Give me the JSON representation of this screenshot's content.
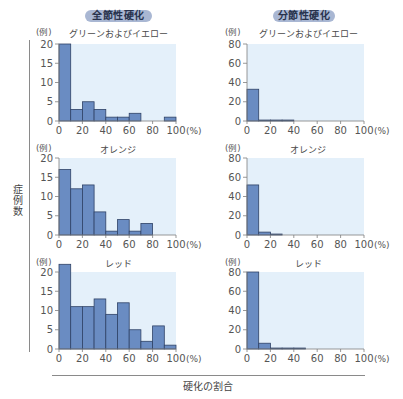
{
  "headers": {
    "left": "全節性硬化",
    "right": "分節性硬化"
  },
  "labels": {
    "y_axis": "症例数",
    "x_axis": "硬化の割合",
    "count_unit": "(例)",
    "percent_unit": "(%)"
  },
  "colors": {
    "pill_bg": "#a9b7d3",
    "plot_bg": "#e4f0fa",
    "bar_fill": "#6a8cc2",
    "bar_stroke": "#2f4266",
    "axis": "#7d7d7d",
    "tick_text": "#555555"
  },
  "chart_data": [
    {
      "type": "bar",
      "group": "全節性硬化",
      "title": "グリーンおよびイエロー",
      "bin_edges": [
        0,
        10,
        20,
        30,
        40,
        50,
        60,
        70,
        80,
        90,
        100
      ],
      "categories": [
        "0-10",
        "10-20",
        "20-30",
        "30-40",
        "40-50",
        "50-60",
        "60-70",
        "70-80",
        "80-90",
        "90-100"
      ],
      "values": [
        20,
        3,
        5,
        3,
        1,
        1,
        2,
        0,
        0,
        1
      ],
      "xlabel": "硬化の割合 (%)",
      "ylabel": "症例数 (例)",
      "ylim": [
        0,
        20
      ],
      "yticks": [
        0,
        5,
        10,
        15,
        20
      ],
      "xticks": [
        0,
        20,
        40,
        60,
        80,
        100
      ],
      "grid": false
    },
    {
      "type": "bar",
      "group": "全節性硬化",
      "title": "オレンジ",
      "bin_edges": [
        0,
        10,
        20,
        30,
        40,
        50,
        60,
        70,
        80,
        90,
        100
      ],
      "categories": [
        "0-10",
        "10-20",
        "20-30",
        "30-40",
        "40-50",
        "50-60",
        "60-70",
        "70-80",
        "80-90",
        "90-100"
      ],
      "values": [
        17,
        12,
        13,
        6,
        1,
        4,
        1,
        3,
        0,
        0
      ],
      "xlabel": "硬化の割合 (%)",
      "ylabel": "症例数 (例)",
      "ylim": [
        0,
        20
      ],
      "yticks": [
        0,
        5,
        10,
        15,
        20
      ],
      "xticks": [
        0,
        20,
        40,
        60,
        80,
        100
      ],
      "grid": false
    },
    {
      "type": "bar",
      "group": "全節性硬化",
      "title": "レッド",
      "bin_edges": [
        0,
        10,
        20,
        30,
        40,
        50,
        60,
        70,
        80,
        90,
        100
      ],
      "categories": [
        "0-10",
        "10-20",
        "20-30",
        "30-40",
        "40-50",
        "50-60",
        "60-70",
        "70-80",
        "80-90",
        "90-100"
      ],
      "values": [
        22,
        11,
        11,
        13,
        9,
        12,
        5,
        2,
        6,
        1
      ],
      "xlabel": "硬化の割合 (%)",
      "ylabel": "症例数 (例)",
      "ylim": [
        0,
        20
      ],
      "yticks": [
        0,
        5,
        10,
        15,
        20
      ],
      "xticks": [
        0,
        20,
        40,
        60,
        80,
        100
      ],
      "grid": false
    },
    {
      "type": "bar",
      "group": "分節性硬化",
      "title": "グリーンおよびイエロー",
      "bin_edges": [
        0,
        10,
        20,
        30,
        40,
        50,
        60,
        70,
        80,
        90,
        100
      ],
      "categories": [
        "0-10",
        "10-20",
        "20-30",
        "30-40",
        "40-50",
        "50-60",
        "60-70",
        "70-80",
        "80-90",
        "90-100"
      ],
      "values": [
        33,
        1,
        1,
        1,
        0,
        0,
        0,
        0,
        0,
        0
      ],
      "xlabel": "硬化の割合 (%)",
      "ylabel": "症例数 (例)",
      "ylim": [
        0,
        80
      ],
      "yticks": [
        0,
        20,
        40,
        60,
        80
      ],
      "xticks": [
        0,
        20,
        40,
        60,
        80,
        100
      ],
      "grid": false
    },
    {
      "type": "bar",
      "group": "分節性硬化",
      "title": "オレンジ",
      "bin_edges": [
        0,
        10,
        20,
        30,
        40,
        50,
        60,
        70,
        80,
        90,
        100
      ],
      "categories": [
        "0-10",
        "10-20",
        "20-30",
        "30-40",
        "40-50",
        "50-60",
        "60-70",
        "70-80",
        "80-90",
        "90-100"
      ],
      "values": [
        52,
        3,
        1,
        0,
        0,
        0,
        0,
        0,
        0,
        0
      ],
      "xlabel": "硬化の割合 (%)",
      "ylabel": "症例数 (例)",
      "ylim": [
        0,
        80
      ],
      "yticks": [
        0,
        20,
        40,
        60,
        80
      ],
      "xticks": [
        0,
        20,
        40,
        60,
        80,
        100
      ],
      "grid": false
    },
    {
      "type": "bar",
      "group": "分節性硬化",
      "title": "レッド",
      "bin_edges": [
        0,
        10,
        20,
        30,
        40,
        50,
        60,
        70,
        80,
        90,
        100
      ],
      "categories": [
        "0-10",
        "10-20",
        "20-30",
        "30-40",
        "40-50",
        "50-60",
        "60-70",
        "70-80",
        "80-90",
        "90-100"
      ],
      "values": [
        80,
        6,
        1,
        1,
        1,
        0,
        0,
        0,
        0,
        0
      ],
      "xlabel": "硬化の割合 (%)",
      "ylabel": "症例数 (例)",
      "ylim": [
        0,
        80
      ],
      "yticks": [
        0,
        20,
        40,
        60,
        80
      ],
      "xticks": [
        0,
        20,
        40,
        60,
        80,
        100
      ],
      "grid": false
    }
  ]
}
